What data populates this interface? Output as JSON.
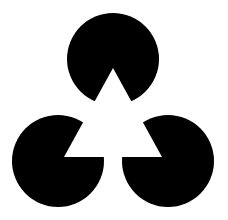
{
  "figure": {
    "title": "",
    "background": "#ffffff",
    "fill": "#000000",
    "shapes": {
      "top_circle": {
        "cx": 113,
        "cy": 59,
        "r": 46
      },
      "bottom_left_circle": {
        "cx": 58,
        "cy": 161,
        "r": 46
      },
      "bottom_right_circle": {
        "cx": 168,
        "cy": 161,
        "r": 46
      },
      "illusory_triangle": [
        [
          113,
          68
        ],
        [
          64,
          157
        ],
        [
          162,
          157
        ]
      ]
    }
  }
}
